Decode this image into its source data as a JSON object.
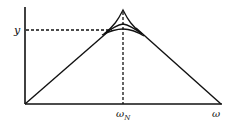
{
  "diagram": {
    "type": "frequency-response-asymptote",
    "axes": {
      "y_label": "y",
      "x_label": "ω",
      "x_marker_label": "ω",
      "x_marker_subscript": "N"
    },
    "curves": [
      {
        "name": "asymptote",
        "description": "straight-line triangle peaking at ω_N"
      },
      {
        "name": "resonance-curve-high",
        "description": "curve rising to sharp peak"
      },
      {
        "name": "resonance-curve-mid",
        "description": "curve with moderate hump"
      },
      {
        "name": "resonance-curve-low",
        "description": "smooth rounded curve"
      }
    ],
    "guides": {
      "horizontal_dashed": "y level",
      "vertical_dashed": "ω_N"
    },
    "colors": {
      "line": "#111111",
      "background": "#ffffff"
    }
  }
}
